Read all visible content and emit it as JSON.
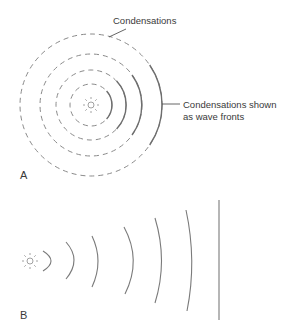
{
  "figure": {
    "panel_a": {
      "label": "A",
      "annotations": {
        "condensations": "Condensations",
        "wave_fronts_line1": "Condensations shown",
        "wave_fronts_line2": "as wave fronts"
      },
      "source": {
        "cx": 91,
        "cy": 105,
        "icon": "sun-icon"
      },
      "radii": [
        21,
        35,
        51,
        71
      ]
    },
    "panel_b": {
      "label": "B",
      "source": {
        "cx": 30,
        "cy": 261,
        "icon": "sun-icon"
      },
      "arcs": [
        {
          "x_top": 42,
          "y_top": 250,
          "x_mid": 53,
          "y_bot": 271
        },
        {
          "x_top": 66,
          "y_top": 242,
          "x_mid": 74,
          "y_bot": 278
        },
        {
          "x_top": 92,
          "y_top": 236,
          "x_mid": 98,
          "y_bot": 286
        },
        {
          "x_top": 124,
          "y_top": 227,
          "x_mid": 133,
          "y_bot": 294
        },
        {
          "x_top": 155,
          "y_top": 218,
          "x_mid": 161,
          "y_bot": 303
        },
        {
          "x_top": 186,
          "y_top": 210,
          "x_mid": 191,
          "y_bot": 311
        }
      ],
      "plane_wave": {
        "x": 219,
        "y_top": 200,
        "y_bot": 320
      }
    },
    "colors": {
      "line": "#7a7a7a",
      "text": "#3a3a3a"
    }
  }
}
